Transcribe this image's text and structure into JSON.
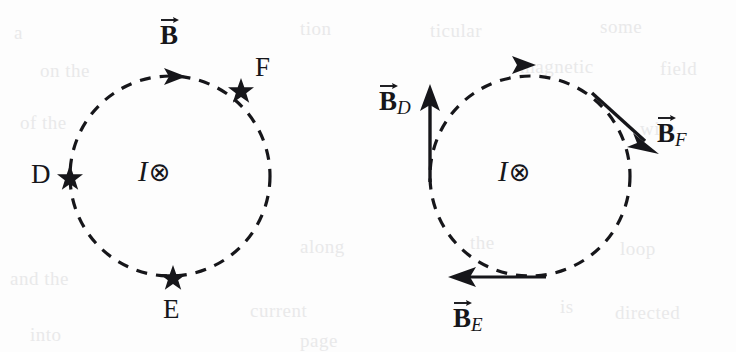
{
  "figure": {
    "background_color": "#fdfdfd",
    "ink_color": "#16161a"
  },
  "panels": [
    {
      "id": "left",
      "name": "field-line-panel",
      "circle": {
        "cx": 170,
        "cy": 176,
        "r": 100,
        "style": "dashed"
      },
      "current": {
        "symbol_letter": "I",
        "symbol_glyph": "⊗",
        "direction": "into-page"
      },
      "field_label": {
        "text": "B",
        "vector": true
      },
      "direction_arrow": {
        "at_angle_deg": 270,
        "sense": "clockwise"
      },
      "points": [
        {
          "label": "D",
          "angle_deg": 180,
          "marker": "star"
        },
        {
          "label": "E",
          "angle_deg": 90,
          "marker": "star"
        },
        {
          "label": "F",
          "angle_deg": 315,
          "marker": "star"
        }
      ]
    },
    {
      "id": "right",
      "name": "field-vector-panel",
      "circle": {
        "cx": 530,
        "cy": 176,
        "r": 100,
        "style": "dashed"
      },
      "current": {
        "symbol_letter": "I",
        "symbol_glyph": "⊗",
        "direction": "into-page"
      },
      "direction_arrow": {
        "at_angle_deg": 270,
        "sense": "clockwise"
      },
      "vectors": [
        {
          "base": "B",
          "subscript": "D",
          "at_point": "D",
          "points_toward": "up",
          "angle_deg": 90
        },
        {
          "base": "B",
          "subscript": "E",
          "at_point": "E",
          "points_toward": "left",
          "angle_deg": 180
        },
        {
          "base": "B",
          "subscript": "F",
          "at_point": "F",
          "points_toward": "down-right",
          "angle_deg": -45
        }
      ]
    }
  ],
  "labels": {
    "left_B": "B",
    "left_D": "D",
    "left_E": "E",
    "left_F": "F",
    "current_letter": "I",
    "current_glyph": "⊗",
    "vec_base": "B",
    "sub_D": "D",
    "sub_E": "E",
    "sub_F": "F"
  },
  "bleed_text": [
    {
      "text": "a",
      "x": 14,
      "y": 22
    },
    {
      "text": "tion",
      "x": 300,
      "y": 18
    },
    {
      "text": "ticular",
      "x": 430,
      "y": 20
    },
    {
      "text": "some",
      "x": 600,
      "y": 16
    },
    {
      "text": "on the",
      "x": 40,
      "y": 60
    },
    {
      "text": "magnetic",
      "x": 520,
      "y": 56
    },
    {
      "text": "field",
      "x": 660,
      "y": 58
    },
    {
      "text": "of the",
      "x": 20,
      "y": 112
    },
    {
      "text": "wire",
      "x": 640,
      "y": 118
    },
    {
      "text": "along",
      "x": 300,
      "y": 236
    },
    {
      "text": "the",
      "x": 470,
      "y": 232
    },
    {
      "text": "loop",
      "x": 620,
      "y": 238
    },
    {
      "text": "and the",
      "x": 10,
      "y": 268
    },
    {
      "text": "current",
      "x": 250,
      "y": 300
    },
    {
      "text": "is",
      "x": 560,
      "y": 296
    },
    {
      "text": "directed",
      "x": 615,
      "y": 302
    },
    {
      "text": "into",
      "x": 30,
      "y": 324
    },
    {
      "text": "page",
      "x": 300,
      "y": 330
    }
  ]
}
